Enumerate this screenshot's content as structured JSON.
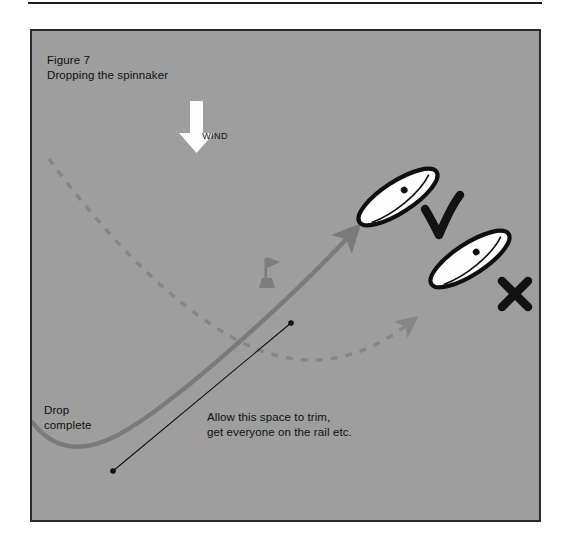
{
  "figure": {
    "caption_line1": "Figure 7",
    "caption_line2": "Dropping the spinnaker",
    "wind_label": "WIND",
    "drop_complete_line1": "Drop",
    "drop_complete_line2": "complete",
    "trim_note_line1": "Allow this space to trim,",
    "trim_note_line2": "get everyone on the rail etc."
  },
  "colors": {
    "panel_background": "#9e9e9e",
    "panel_border": "#2b2b2b",
    "page_background": "#ffffff",
    "track_solid": "#7a7a7a",
    "track_dashed": "#868686",
    "wind_arrow": "#fdfdfd",
    "boat_hull_fill": "#fdfdfd",
    "boat_outline": "#0f0f0f",
    "mark_buoy": "#7d7d7d",
    "annotation_line": "#111111",
    "text": "#101010"
  },
  "marks": {
    "good_mark": "check-mark",
    "bad_mark": "cross-mark"
  },
  "elements": {
    "wind_arrow_name": "wind-direction-arrow",
    "solid_track_name": "correct-course-track",
    "dashed_track_name": "incorrect-course-track",
    "buoy_name": "racing-mark-buoy",
    "span_arrow_name": "space-to-trim-span",
    "boat_good_name": "boat-correct-position",
    "boat_bad_name": "boat-late-position"
  }
}
